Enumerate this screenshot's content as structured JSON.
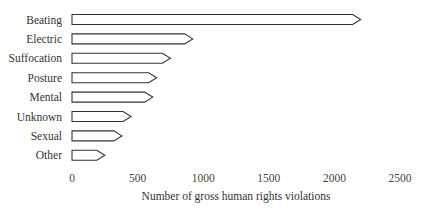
{
  "chart_data": {
    "type": "bar",
    "orientation": "horizontal",
    "title": "",
    "xlabel": "Number of gross human rights violations",
    "ylabel": "",
    "categories": [
      "Beating",
      "Electric",
      "Suffocation",
      "Posture",
      "Mental",
      "Unknown",
      "Sexual",
      "Other"
    ],
    "values": [
      2200,
      920,
      750,
      645,
      615,
      450,
      380,
      250
    ],
    "xlim": [
      0,
      2500
    ],
    "xticks": [
      0,
      500,
      1000,
      1500,
      2000,
      2500
    ],
    "grid": false,
    "legend": null,
    "bar_style": "outlined arrow-tipped bars"
  }
}
